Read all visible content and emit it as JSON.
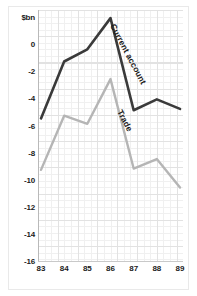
{
  "chart_data": {
    "type": "line",
    "title": "",
    "subtitle": "",
    "xlabel": "",
    "ylabel": "$bn",
    "unit_label": "$bn",
    "x": [
      "83",
      "84",
      "85",
      "86",
      "87",
      "88",
      "89"
    ],
    "categories": [
      "83",
      "84",
      "85",
      "86",
      "87",
      "88",
      "89"
    ],
    "xlim": [
      83,
      89
    ],
    "ylim": [
      -16,
      2.6
    ],
    "yticks": [
      0,
      -2,
      -4,
      -6,
      -8,
      -10,
      -12,
      -14,
      -16
    ],
    "ytick_labels": [
      "0",
      "-2",
      "-4",
      "-6",
      "-8",
      "-10",
      "-12",
      "-14",
      "-16"
    ],
    "grid": true,
    "legend": "inline-annotations",
    "series": [
      {
        "name": "Current account",
        "color": "#3a3a3a",
        "values": [
          -5.4,
          -1.2,
          -0.3,
          2.0,
          -4.8,
          -4.0,
          -4.7
        ]
      },
      {
        "name": "Trade",
        "color": "#b5b5b5",
        "values": [
          -9.2,
          -5.2,
          -5.8,
          -2.5,
          -9.1,
          -8.4,
          -10.5
        ]
      }
    ],
    "annotations": [
      {
        "text": "Current account",
        "series": "Current account"
      },
      {
        "text": "Trade",
        "series": "Trade"
      }
    ],
    "colors": {
      "background": "#ffffff",
      "grid_minor": "#f0f0f0",
      "grid_major": "#e2e2e2",
      "axis": "#b9b9b9",
      "text": "#1b1b1b",
      "current_account": "#3a3a3a",
      "trade": "#b5b5b5"
    }
  }
}
